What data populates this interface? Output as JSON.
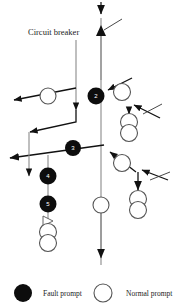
{
  "diagram": {
    "title_label": "Circuit breaker",
    "type": "power-distribution-single-line-diagram",
    "colors": {
      "fault": "#0d0d0d",
      "normal": "#ffffff",
      "stroke": "#4a4a4a",
      "arrow": "#111111",
      "text": "#1a1a1a",
      "background": "#ffffff"
    },
    "fault_nodes": [
      {
        "id": "1",
        "label": "1",
        "x": 96,
        "y": 96
      },
      {
        "id": "2",
        "label": "2",
        "x": 96,
        "y": 96
      },
      {
        "id": "3",
        "label": "3",
        "x": 73,
        "y": 148
      },
      {
        "id": "4",
        "label": "4",
        "x": 48,
        "y": 176
      },
      {
        "id": "5",
        "label": "5",
        "x": 48,
        "y": 204
      }
    ],
    "normal_nodes": [
      {
        "x": 48,
        "y": 96
      },
      {
        "x": 122,
        "y": 92
      },
      {
        "x": 129,
        "y": 121
      },
      {
        "x": 129,
        "y": 131
      },
      {
        "x": 122,
        "y": 163
      },
      {
        "x": 138,
        "y": 198
      },
      {
        "x": 138,
        "y": 208
      },
      {
        "x": 48,
        "y": 231
      },
      {
        "x": 48,
        "y": 241
      },
      {
        "x": 101,
        "y": 205
      }
    ],
    "breakers": [
      {
        "x": 104,
        "y": 30
      },
      {
        "x": 148,
        "y": 110
      },
      {
        "x": 157,
        "y": 182
      },
      {
        "x": 48,
        "y": 220
      }
    ]
  },
  "legend": {
    "items": [
      {
        "marker": "filled-circle",
        "label": "Fault prompt"
      },
      {
        "marker": "hollow-circle",
        "label": "Normal prompt"
      }
    ],
    "fault_label": "Fault prompt",
    "normal_label": "Normal prompt"
  }
}
